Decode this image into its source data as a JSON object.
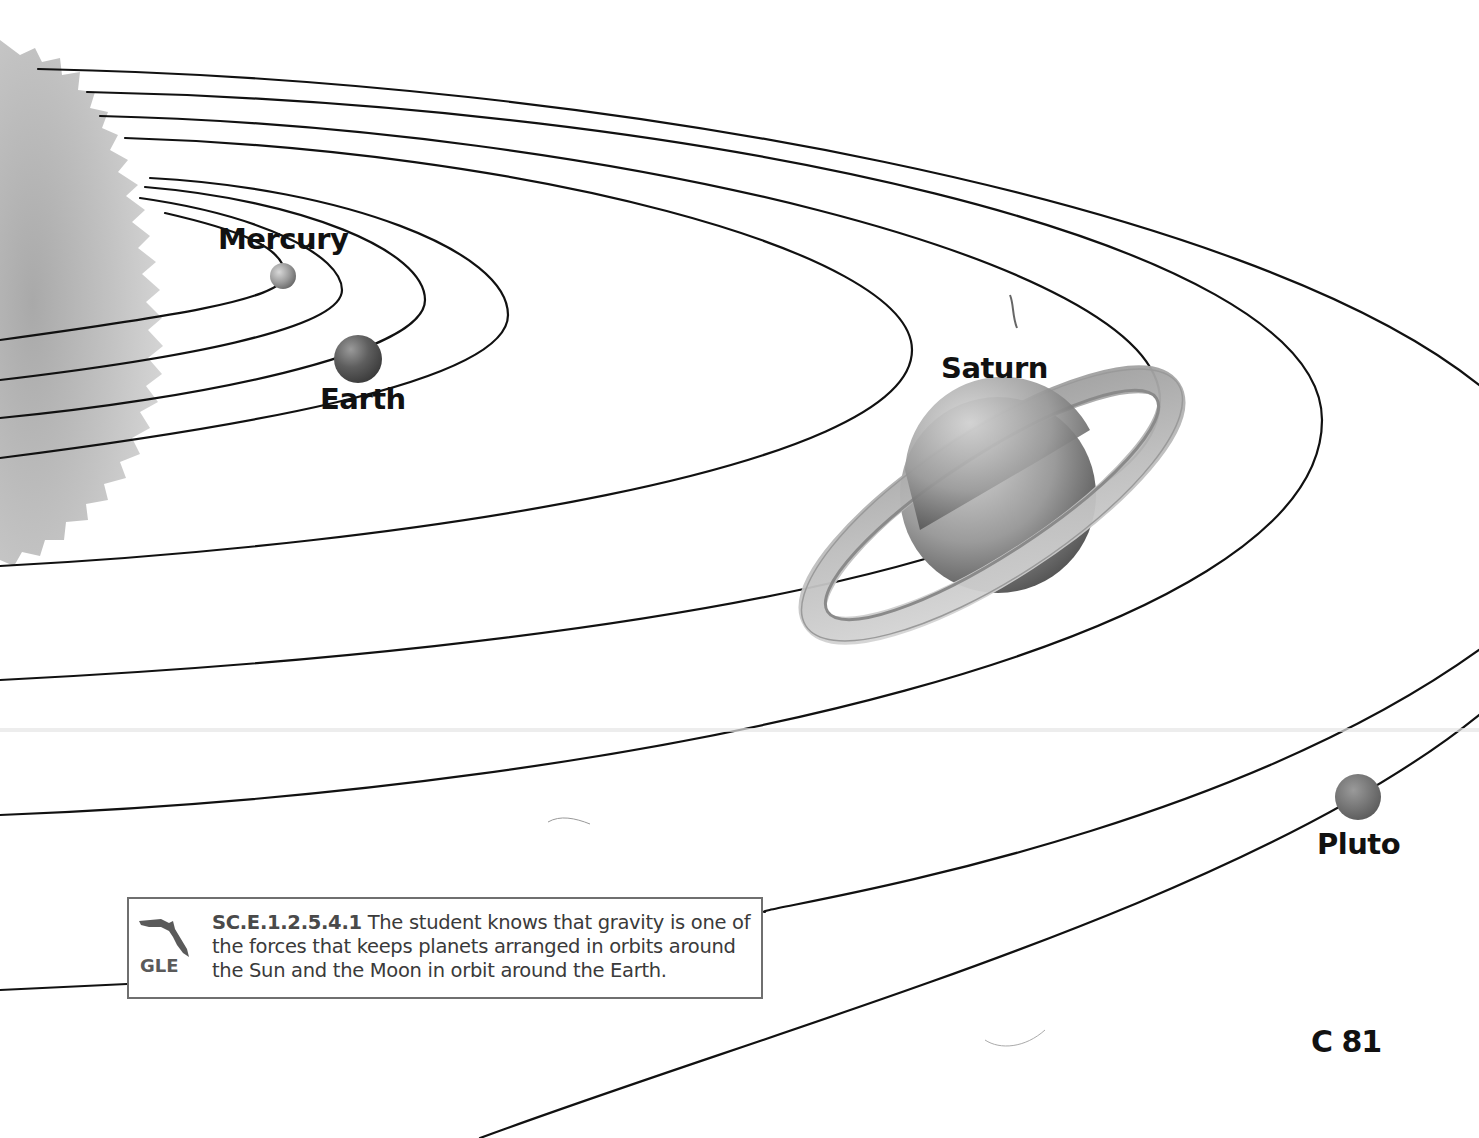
{
  "diagram": {
    "type": "solar-system-orbits",
    "orbit_count": 9,
    "sun": {
      "position": "left edge, partially visible"
    },
    "planets": [
      {
        "name": "Mercury",
        "label": "Mercury"
      },
      {
        "name": "Earth",
        "label": "Earth"
      },
      {
        "name": "Saturn",
        "label": "Saturn"
      },
      {
        "name": "Pluto",
        "label": "Pluto"
      }
    ]
  },
  "standard_box": {
    "badge": "GLE",
    "icon": "florida-state-icon",
    "code": "SC.E.1.2.5.4.1",
    "text_line1": " The student knows that gravity is one of",
    "text_line2": "the forces that keeps planets arranged in orbits around",
    "text_line3": "the Sun and the Moon in orbit around the Earth."
  },
  "page": {
    "number": "C 81"
  },
  "colors": {
    "orbit_line": "#111111",
    "sun": "#b8b8b8",
    "box_border": "#6f6f6f",
    "text": "#3a3a3a"
  }
}
